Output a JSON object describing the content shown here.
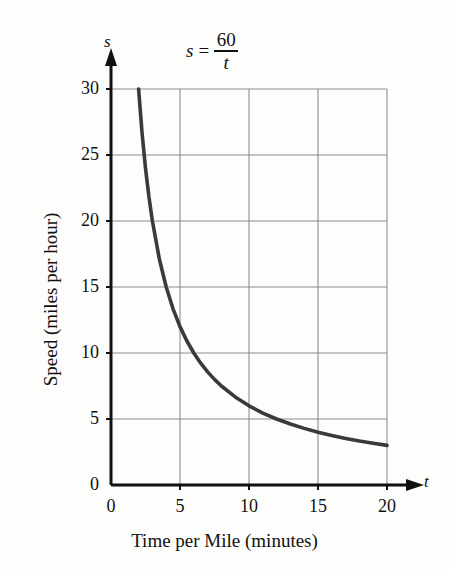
{
  "figure": {
    "equation": {
      "lhs": "s",
      "operator": "=",
      "numerator": "60",
      "denominator": "t"
    },
    "axis_variables": {
      "y": "s",
      "x": "t"
    },
    "colors": {
      "curve": "#3a3a3a",
      "axis": "#111111",
      "grid": "#8d8d8d",
      "background": "#fdfdfc"
    }
  },
  "chart_data": {
    "type": "line",
    "xlabel": "Time per Mile (minutes)",
    "ylabel": "Speed (miles per hour)",
    "x_variable": "t",
    "y_variable": "s",
    "xlim": [
      0,
      20
    ],
    "ylim": [
      0,
      30
    ],
    "grid": true,
    "legend": "none",
    "xticks": [
      "0",
      "5",
      "10",
      "15",
      "20"
    ],
    "xtick_values": [
      0,
      5,
      10,
      15,
      20
    ],
    "yticks": [
      "0",
      "5",
      "10",
      "15",
      "20",
      "25",
      "30"
    ],
    "ytick_values": [
      0,
      5,
      10,
      15,
      20,
      25,
      30
    ],
    "equation": "s = 60 / t",
    "series": [
      {
        "name": "s = 60/t",
        "x": [
          2,
          2.25,
          2.5,
          2.75,
          3,
          3.5,
          4,
          4.5,
          5,
          5.5,
          6,
          6.5,
          7,
          7.5,
          8,
          9,
          10,
          11,
          12,
          13,
          14,
          15,
          16,
          17,
          18,
          19,
          20
        ],
        "values": [
          30,
          26.67,
          24,
          21.82,
          20,
          17.14,
          15,
          13.33,
          12,
          10.91,
          10,
          9.23,
          8.57,
          8,
          7.5,
          6.67,
          6,
          5.45,
          5,
          4.62,
          4.29,
          4,
          3.75,
          3.53,
          3.33,
          3.16,
          3
        ]
      }
    ]
  }
}
